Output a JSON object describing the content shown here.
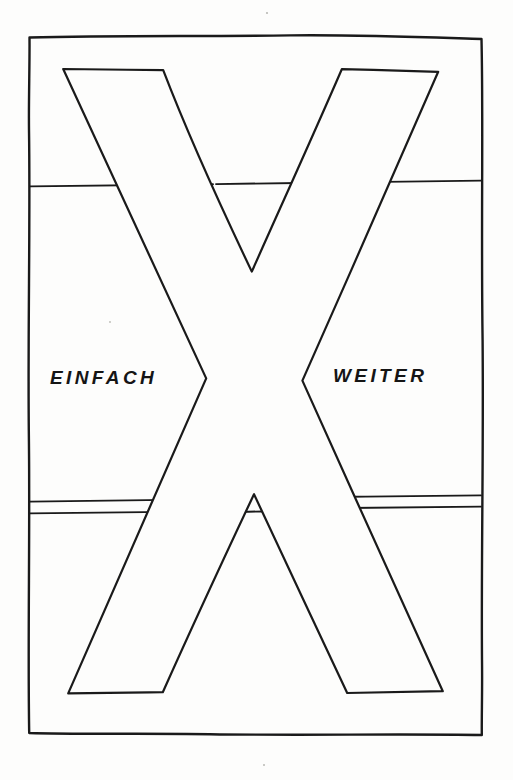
{
  "artwork": {
    "medium": "hand-drawn ink sketch",
    "caption_left": "EINFACH",
    "caption_right": "WEITER",
    "phrase": "EINFACH WEITER",
    "central_glyph": "X",
    "ink_color": "#1a1a1a",
    "paper_color": "#fdfdfc",
    "caption_color": "#151515"
  },
  "frame": {
    "name": "hand-drawn rectangle border",
    "top_left": [
      29,
      37
    ],
    "top_right": [
      482,
      39
    ],
    "bottom_right": [
      482,
      735
    ],
    "bottom_left": [
      29,
      733
    ]
  },
  "bands": {
    "upper": {
      "label": "upper horizon line",
      "count": 1,
      "left_y": 186,
      "right_y": 181
    },
    "lower": {
      "label": "lower double horizon line",
      "count": 2,
      "left_y": [
        501,
        513
      ],
      "right_y": [
        496,
        507
      ]
    }
  },
  "glyph_geometry": {
    "top_left_arm": [
      [
        63,
        69
      ],
      [
        163,
        70
      ]
    ],
    "top_right_arm": [
      [
        342,
        69
      ],
      [
        438,
        72
      ]
    ],
    "bottom_left_foot": [
      [
        68,
        693
      ],
      [
        163,
        692
      ]
    ],
    "bottom_right_foot": [
      [
        347,
        693
      ],
      [
        443,
        691
      ]
    ],
    "waist_left_vertex": [
      206,
      378
    ],
    "waist_right_vertex": [
      302,
      381
    ],
    "upper_valley": [
      252,
      272
    ],
    "lower_apex": [
      254,
      494
    ]
  }
}
